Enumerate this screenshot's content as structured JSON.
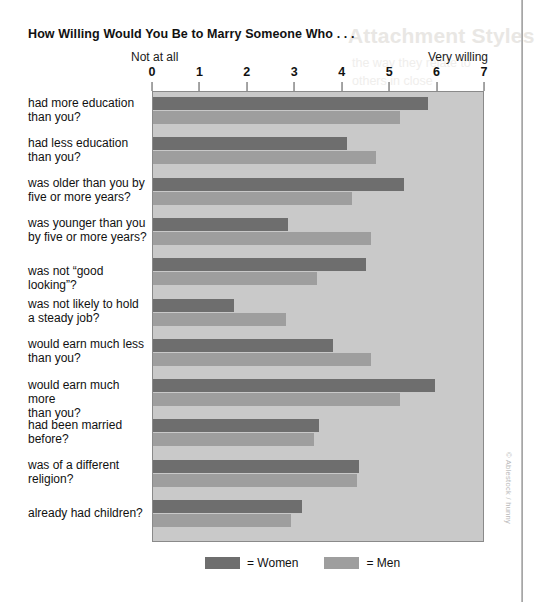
{
  "title": "How Willing Would You Be to Marry Someone Who . . .",
  "anchors": {
    "left": "Not at all",
    "right": "Very willing"
  },
  "legend": {
    "women_label": "= Women",
    "men_label": "= Men"
  },
  "credit": "© Ablestock / hunny",
  "ghost": {
    "heading": "Attachment Styles",
    "line1": "the way they relate to",
    "line2": "others in close"
  },
  "colors": {
    "women": "#6e6e6e",
    "men": "#9e9e9e",
    "plot_background": "#c9c9c9",
    "plot_border": "#8a8a8a",
    "page_background": "#ffffff",
    "text": "#111111"
  },
  "chart_data": {
    "type": "bar",
    "orientation": "horizontal",
    "title": "How Willing Would You Be to Marry Someone Who . . .",
    "xlabel": "",
    "ylabel": "",
    "xlim": [
      0,
      7
    ],
    "xticks": [
      0,
      1,
      2,
      3,
      4,
      5,
      6,
      7
    ],
    "xtick_labels": [
      "0",
      "1",
      "2",
      "3",
      "4",
      "5",
      "6",
      "7"
    ],
    "scale_anchor_low": "Not at all",
    "scale_anchor_high": "Very willing",
    "grid": false,
    "legend_position": "bottom",
    "categories": [
      "had more education than you?",
      "had less education than you?",
      "was older than you by five or more years?",
      "was younger than you by five or more years?",
      "was not “good looking”?",
      "was not likely to hold a steady job?",
      "would earn much less than you?",
      "would earn much more than you?",
      "had been married before?",
      "was of a different religion?",
      "already had children?"
    ],
    "series": [
      {
        "name": "Women",
        "color": "#6e6e6e",
        "values": [
          5.8,
          4.1,
          5.3,
          2.85,
          4.5,
          1.7,
          3.8,
          5.95,
          3.5,
          4.35,
          3.15
        ]
      },
      {
        "name": "Men",
        "color": "#9e9e9e",
        "values": [
          5.2,
          4.7,
          4.2,
          4.6,
          3.45,
          2.8,
          4.6,
          5.2,
          3.4,
          4.3,
          2.9
        ]
      }
    ]
  },
  "category_lines": [
    [
      "had more education",
      "than you?"
    ],
    [
      "had less education",
      "than you?"
    ],
    [
      "was older than you by",
      "five or more years?"
    ],
    [
      "was younger than you",
      "by five or more years?"
    ],
    [
      "was not “good looking”?"
    ],
    [
      "was not likely to hold",
      "a steady job?"
    ],
    [
      "would earn much less",
      "than you?"
    ],
    [
      "would earn much more",
      "than you?"
    ],
    [
      "had been married",
      "before?"
    ],
    [
      "was of a different",
      "religion?"
    ],
    [
      "already had children?"
    ]
  ]
}
